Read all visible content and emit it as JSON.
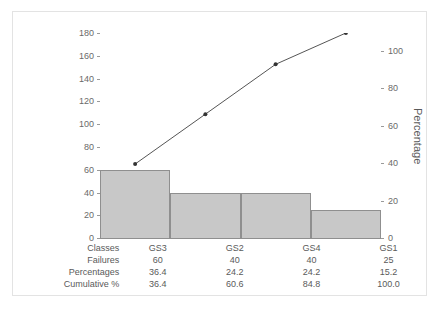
{
  "chart_data": {
    "type": "bar",
    "title": "",
    "subtitle": "",
    "xlabel": "",
    "ylabel": "Failures",
    "y2label": "Percentage",
    "categories": [
      "GS3",
      "GS2",
      "GS4",
      "GS1"
    ],
    "values": [
      60,
      40,
      40,
      25
    ],
    "percentages": [
      36.4,
      24.2,
      24.2,
      15.2
    ],
    "cumulative": [
      36.4,
      60.6,
      84.8,
      100.0
    ],
    "ylim": [
      0,
      180
    ],
    "y2lim": [
      0,
      100
    ],
    "yticks": [
      0,
      20,
      40,
      60,
      80,
      100,
      120,
      140,
      160,
      180
    ],
    "y2ticks": [
      0,
      20,
      40,
      60,
      80,
      100
    ],
    "grid": false,
    "legend": "none",
    "series": [
      {
        "name": "Failures",
        "type": "bar",
        "axis": "left",
        "values": [
          60,
          40,
          40,
          25
        ]
      },
      {
        "name": "Cumulative %",
        "type": "line",
        "axis": "right",
        "values": [
          36.4,
          60.6,
          84.8,
          100.0
        ]
      }
    ],
    "bar_color": "#c8c8c8",
    "bar_border_color": "#8f8f8f",
    "line_color": "#555555",
    "marker_color": "#333333"
  },
  "axes": {
    "left_title": "Failures",
    "right_title": "Percentage",
    "left_ticks": [
      "180",
      "160",
      "140",
      "120",
      "100",
      "80",
      "60",
      "40",
      "20",
      "0"
    ],
    "right_ticks": [
      "100",
      "80",
      "60",
      "40",
      "20",
      "0"
    ]
  },
  "table": {
    "rows": [
      {
        "label": "Classes",
        "cells": [
          "GS3",
          "GS2",
          "GS4",
          "GS1"
        ]
      },
      {
        "label": "Failures",
        "cells": [
          "60",
          "40",
          "40",
          "25"
        ]
      },
      {
        "label": "Percentages",
        "cells": [
          "36.4",
          "24.2",
          "24.2",
          "15.2"
        ]
      },
      {
        "label": "Cumulative %",
        "cells": [
          "36.4",
          "60.6",
          "84.8",
          "100.0"
        ]
      }
    ]
  }
}
